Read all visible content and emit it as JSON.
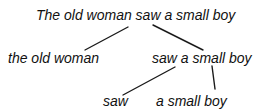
{
  "tree": {
    "root": {
      "label": "The old woman saw a small boy"
    },
    "left": {
      "label": "the old woman"
    },
    "right": {
      "label": "saw a small boy",
      "children": [
        {
          "label": "saw"
        },
        {
          "label": "a small boy"
        }
      ]
    }
  },
  "colors": {
    "text": "#111111",
    "edge": "#1a1a1a",
    "background": "#ffffff"
  }
}
